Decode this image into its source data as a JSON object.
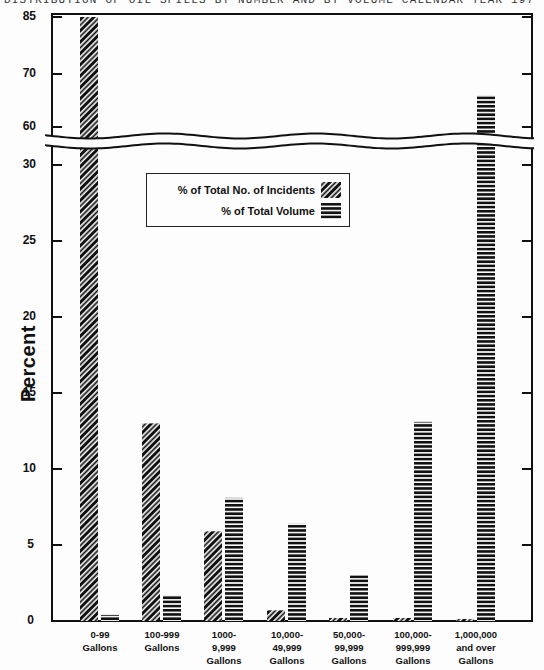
{
  "title": "DISTRIBUTION OF OIL SPILLS BY NUMBER AND BY VOLUME CALENDAR YEAR 197",
  "colors": {
    "ink": "#111111",
    "background": "#fdfdfd"
  },
  "legend": {
    "incidents_label": "% of Total No. of Incidents",
    "volume_label": "% of Total Volume",
    "incidents_pattern": "diagonal-hatch-icon",
    "volume_pattern": "horizontal-stripes-icon"
  },
  "axis": {
    "ylabel": "Percent",
    "lower_ticks": [
      "0",
      "5",
      "10",
      "15",
      "20",
      "25",
      "30"
    ],
    "upper_ticks": [
      "60",
      "70",
      "85"
    ],
    "break": "axis break between 30 and 60"
  },
  "chart_data": {
    "type": "bar",
    "title": "Distribution of Oil Spills by Number and by Volume",
    "xlabel": "",
    "ylabel": "Percent",
    "categories": [
      "0-99 Gallons",
      "100-999 Gallons",
      "1000-9,999 Gallons",
      "10,000-49,999 Gallons",
      "50,000-99,999 Gallons",
      "100,000-999,999 Gallons",
      "1,000,000 and over Gallons"
    ],
    "category_lines": [
      [
        "0-99",
        "Gallons"
      ],
      [
        "100-999",
        "Gallons"
      ],
      [
        "1000-",
        "9,999",
        "Gallons"
      ],
      [
        "10,000-",
        "49,999",
        "Gallons"
      ],
      [
        "50,000-",
        "99,999",
        "Gallons"
      ],
      [
        "100,000-",
        "999,999",
        "Gallons"
      ],
      [
        "1,000,000",
        "and over",
        "Gallons"
      ]
    ],
    "series": [
      {
        "name": "% of Total No. of Incidents",
        "pattern": "diagonal-hatch",
        "values": [
          85,
          13.0,
          5.9,
          0.7,
          0.2,
          0.2,
          0.1
        ]
      },
      {
        "name": "% of Total Volume",
        "pattern": "horizontal-stripes",
        "values": [
          0.4,
          1.7,
          8.1,
          6.4,
          3.0,
          13.1,
          66
        ]
      }
    ],
    "ylim": [
      0,
      85
    ],
    "axis_break": [
      30,
      60
    ],
    "yticks": [
      0,
      5,
      10,
      15,
      20,
      25,
      30,
      60,
      70,
      85
    ],
    "grid": false,
    "legend_position": "upper-left inside plot"
  }
}
